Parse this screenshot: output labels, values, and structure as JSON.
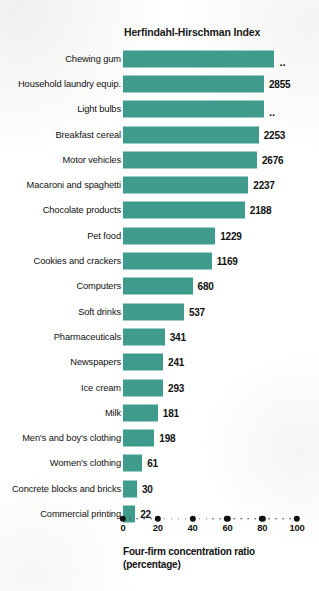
{
  "chart_data": {
    "type": "bar",
    "orientation": "horizontal",
    "title": "Herfindahl-Hirschman Index",
    "xlabel_line1": "Four-firm concentration ratio",
    "xlabel_line2": "(percentage)",
    "ylabel": "",
    "xlim": [
      0,
      100
    ],
    "grid": false,
    "legend": null,
    "accent_color": "#3f9b8c",
    "text_color": "#111111",
    "xticks": [
      0,
      20,
      40,
      60,
      80,
      100
    ],
    "xtick_labels": [
      "0",
      "20",
      "40",
      "60",
      "80",
      "100"
    ],
    "categories": [
      "Chewing gum",
      "Household laundry equip.",
      "Light bulbs",
      "Breakfast cereal",
      "Motor vehicles",
      "Macaroni and spaghetti",
      "Chocolate products",
      "Pet food",
      "Cookies and crackers",
      "Computers",
      "Soft drinks",
      "Pharmaceuticals",
      "Newspapers",
      "Ice cream",
      "Milk",
      "Men's and boy's clothing",
      "Women's clothing",
      "Concrete blocks and bricks",
      "Commercial printing"
    ],
    "values": [
      87,
      81,
      81,
      78,
      77,
      72,
      70,
      53,
      51,
      40,
      35,
      24,
      23,
      23,
      20,
      18,
      11,
      8,
      7
    ],
    "data_labels": [
      "..",
      "2855",
      "..",
      "2253",
      "2676",
      "2237",
      "2188",
      "1229",
      "1169",
      "680",
      "537",
      "341",
      "241",
      "293",
      "181",
      "198",
      "61",
      "30",
      "22"
    ],
    "series_name": "Four-firm concentration ratio",
    "hhi_note": ".. indicates data not available"
  }
}
